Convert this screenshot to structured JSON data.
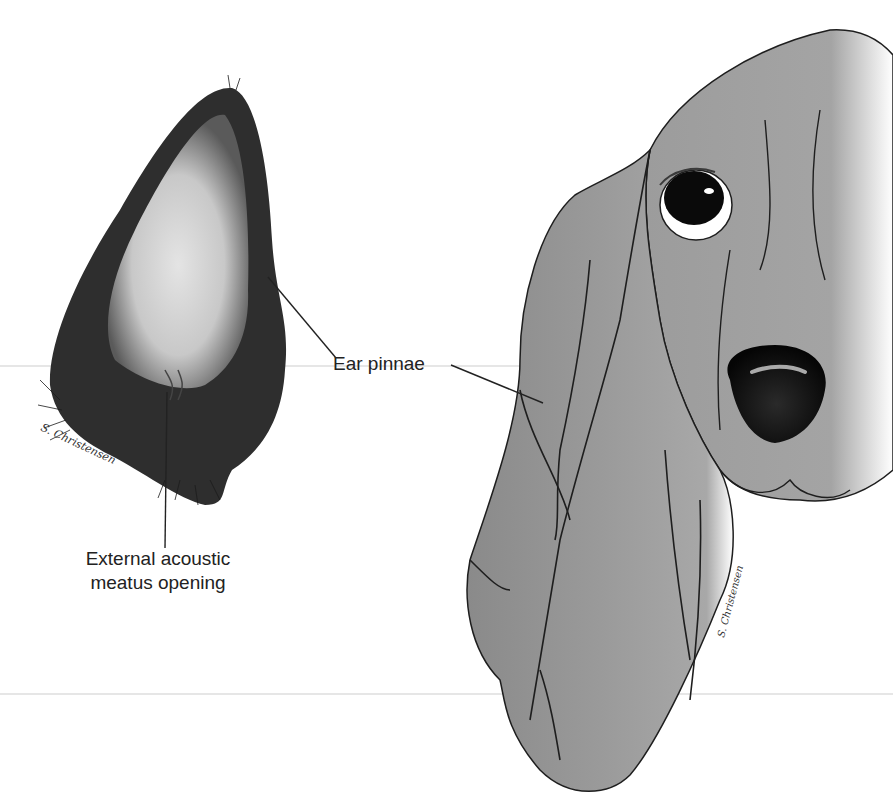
{
  "figure": {
    "labels": {
      "ear_pinnae": "Ear pinnae",
      "meatus_line1": "External acoustic",
      "meatus_line2": "meatus opening"
    },
    "signatures": {
      "left": "S. Christensen",
      "right": "S. Christensen"
    },
    "colors": {
      "background": "#ffffff",
      "dog_skin": "#8c8c8c",
      "dog_skin_light": "#b4b4b4",
      "ear_fur_dark": "#2a2a2a",
      "ear_inner": "#d8d8d8",
      "nose": "#111111",
      "leader_line": "#222222",
      "label_text": "#222222"
    }
  }
}
